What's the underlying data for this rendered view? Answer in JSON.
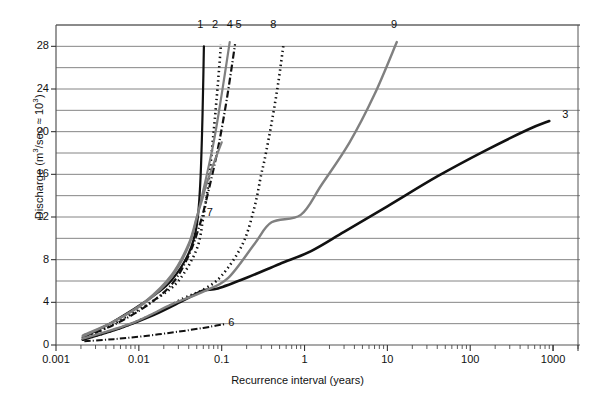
{
  "chart_data": {
    "type": "line",
    "title": "",
    "xlabel": "Recurrence interval (years)",
    "ylabel": "Discharge (m3/sec × 103)",
    "ylabel_parts": {
      "prefix": "Discharge (m",
      "sup1": "3",
      "mid": "/sec ",
      "times": "×",
      "mid2": " 10",
      "sup2": "3",
      "suffix": ")"
    },
    "xscale": "log",
    "yscale": "linear",
    "xlim": [
      0.001,
      2000
    ],
    "ylim": [
      0,
      30
    ],
    "grid": "horizontal",
    "legend": "inline-curve-numbers",
    "xticks": [
      "0.001",
      "0.01",
      "0.1",
      "1",
      "10",
      "100",
      "1000"
    ],
    "xtick_values": [
      0.001,
      0.01,
      0.1,
      1,
      10,
      100,
      1000
    ],
    "yticks": [
      "0",
      "4",
      "8",
      "12",
      "16",
      "20",
      "24",
      "28"
    ],
    "ytick_values": [
      0,
      4,
      8,
      12,
      16,
      20,
      24,
      28
    ],
    "gridline_step": 2,
    "colors": {
      "black": "#111111",
      "gray": "#808080",
      "grid": "#777777",
      "frame": "#555555"
    },
    "series": [
      {
        "name": "1",
        "label": "1",
        "style": "solid",
        "color": "#111111",
        "width": 2.2,
        "label_pos": {
          "x": 0.055,
          "y": 30.0
        },
        "points": [
          [
            0.0021,
            0.7
          ],
          [
            0.004,
            1.8
          ],
          [
            0.008,
            3.2
          ],
          [
            0.015,
            4.6
          ],
          [
            0.025,
            6.1
          ],
          [
            0.04,
            8.6
          ],
          [
            0.05,
            11.2
          ],
          [
            0.055,
            15.0
          ],
          [
            0.058,
            20.0
          ],
          [
            0.06,
            25.0
          ],
          [
            0.061,
            28.0
          ]
        ]
      },
      {
        "name": "2",
        "label": "2",
        "style": "dotted",
        "color": "#111111",
        "width": 2.6,
        "label_pos": {
          "x": 0.083,
          "y": 30.0
        },
        "points": [
          [
            0.0021,
            0.6
          ],
          [
            0.004,
            1.6
          ],
          [
            0.008,
            2.9
          ],
          [
            0.016,
            4.3
          ],
          [
            0.03,
            6.0
          ],
          [
            0.05,
            9.0
          ],
          [
            0.06,
            12.0
          ],
          [
            0.07,
            15.5
          ],
          [
            0.08,
            20.0
          ],
          [
            0.09,
            24.5
          ],
          [
            0.098,
            28.2
          ]
        ]
      },
      {
        "name": "3",
        "label": "3",
        "style": "solid",
        "color": "#111111",
        "width": 2.6,
        "label_pos": {
          "x": 1400,
          "y": 21.6
        },
        "points": [
          [
            0.0021,
            0.5
          ],
          [
            0.006,
            1.6
          ],
          [
            0.015,
            2.8
          ],
          [
            0.035,
            4.2
          ],
          [
            0.06,
            5.1
          ],
          [
            0.09,
            5.3
          ],
          [
            0.2,
            6.3
          ],
          [
            0.5,
            7.6
          ],
          [
            1.2,
            8.8
          ],
          [
            3,
            10.6
          ],
          [
            10,
            13.0
          ],
          [
            40,
            15.8
          ],
          [
            150,
            18.2
          ],
          [
            500,
            20.2
          ],
          [
            900,
            21.0
          ]
        ]
      },
      {
        "name": "4",
        "label": "4",
        "style": "solid",
        "color": "#808080",
        "width": 2.2,
        "label_pos": {
          "x": 0.125,
          "y": 30.0
        },
        "points": [
          [
            0.0021,
            0.9
          ],
          [
            0.005,
            2.2
          ],
          [
            0.012,
            4.0
          ],
          [
            0.025,
            6.4
          ],
          [
            0.04,
            9.3
          ],
          [
            0.05,
            11.9
          ],
          [
            0.06,
            14.5
          ],
          [
            0.08,
            19.0
          ],
          [
            0.1,
            23.5
          ],
          [
            0.125,
            28.4
          ]
        ]
      },
      {
        "name": "5",
        "label": "5",
        "style": "dashdot",
        "color": "#111111",
        "width": 2.2,
        "label_pos": {
          "x": 0.16,
          "y": 30.0
        },
        "points": [
          [
            0.0021,
            0.7
          ],
          [
            0.005,
            1.9
          ],
          [
            0.012,
            3.6
          ],
          [
            0.025,
            5.7
          ],
          [
            0.04,
            8.4
          ],
          [
            0.055,
            11.4
          ],
          [
            0.07,
            14.6
          ],
          [
            0.09,
            18.4
          ],
          [
            0.115,
            23.0
          ],
          [
            0.145,
            28.2
          ]
        ]
      },
      {
        "name": "6",
        "label": "6",
        "style": "dashdot",
        "color": "#111111",
        "width": 2.0,
        "label_pos": {
          "x": 0.13,
          "y": 2.05
        },
        "points": [
          [
            0.0022,
            0.35
          ],
          [
            0.005,
            0.55
          ],
          [
            0.012,
            0.85
          ],
          [
            0.03,
            1.25
          ],
          [
            0.06,
            1.6
          ],
          [
            0.09,
            1.85
          ],
          [
            0.11,
            1.95
          ]
        ]
      },
      {
        "name": "7",
        "label": "7",
        "style": "solid",
        "color": "#808080",
        "width": 2.2,
        "label_pos": {
          "x": 0.072,
          "y": 12.4
        },
        "points": [
          [
            0.0021,
            0.8
          ],
          [
            0.005,
            2.2
          ],
          [
            0.012,
            4.1
          ],
          [
            0.025,
            6.6
          ],
          [
            0.04,
            9.5
          ],
          [
            0.05,
            12.0
          ],
          [
            0.058,
            13.6
          ],
          [
            0.065,
            15.0
          ],
          [
            0.08,
            17.0
          ],
          [
            0.1,
            19.0
          ]
        ]
      },
      {
        "name": "8",
        "label": "8",
        "style": "dotted",
        "color": "#111111",
        "width": 2.6,
        "label_pos": {
          "x": 0.42,
          "y": 30.0
        },
        "points": [
          [
            0.0021,
            0.5
          ],
          [
            0.006,
            1.6
          ],
          [
            0.015,
            2.9
          ],
          [
            0.035,
            4.4
          ],
          [
            0.06,
            5.2
          ],
          [
            0.1,
            6.5
          ],
          [
            0.18,
            9.5
          ],
          [
            0.25,
            13.0
          ],
          [
            0.3,
            16.0
          ],
          [
            0.33,
            17.4
          ],
          [
            0.4,
            20.8
          ],
          [
            0.48,
            24.5
          ],
          [
            0.56,
            28.3
          ]
        ]
      },
      {
        "name": "9",
        "label": "9",
        "style": "solid",
        "color": "#808080",
        "width": 2.4,
        "label_pos": {
          "x": 12,
          "y": 30.0
        },
        "points": [
          [
            0.0021,
            0.6
          ],
          [
            0.008,
            2.0
          ],
          [
            0.025,
            3.8
          ],
          [
            0.06,
            5.0
          ],
          [
            0.12,
            6.3
          ],
          [
            0.25,
            9.5
          ],
          [
            0.4,
            11.5
          ],
          [
            0.9,
            12.2
          ],
          [
            1.6,
            15.0
          ],
          [
            3.5,
            19.0
          ],
          [
            7,
            23.5
          ],
          [
            13,
            28.4
          ]
        ]
      }
    ]
  }
}
